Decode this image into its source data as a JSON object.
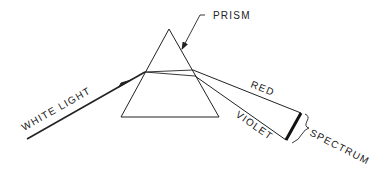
{
  "diagram": {
    "labels": {
      "prism": "PRISM",
      "white_light": "WHITE LIGHT",
      "red": "RED",
      "violet": "VIOLET",
      "spectrum": "SPECTRUM"
    },
    "colors": {
      "stroke": "#222222",
      "background": "#ffffff"
    }
  }
}
